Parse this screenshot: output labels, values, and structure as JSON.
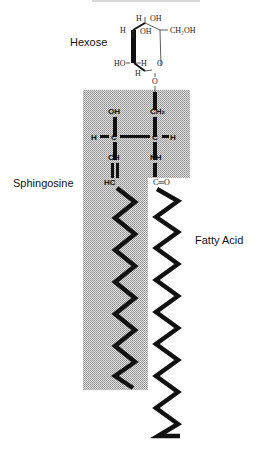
{
  "diagram": {
    "title": "",
    "title_visible": "partially cropped at top edge, not legible",
    "labels": {
      "hexose": "Hexose",
      "sphingosine": "Sphingosine",
      "fatty_acid": "Fatty Acid"
    },
    "hexose_atoms": {
      "h_top": "H",
      "oh_top": "OH",
      "h_left": "H",
      "oh_inner": "OH",
      "ch2oh": "CH₂OH",
      "ho_left": "HO",
      "h_inner": "H",
      "h_bottom": "H",
      "ring_o": "O",
      "link_o": "O"
    },
    "backbone_atoms": {
      "oh": "OH",
      "ch2": "CH₂",
      "h_left": "H",
      "c_left": "C",
      "c_right": "C",
      "h_right": "H",
      "ch": "CH",
      "nh": "NH",
      "hc": "HC",
      "co": "C═O"
    },
    "colors": {
      "shading": "#c8c8c8",
      "line": "#111111"
    }
  }
}
